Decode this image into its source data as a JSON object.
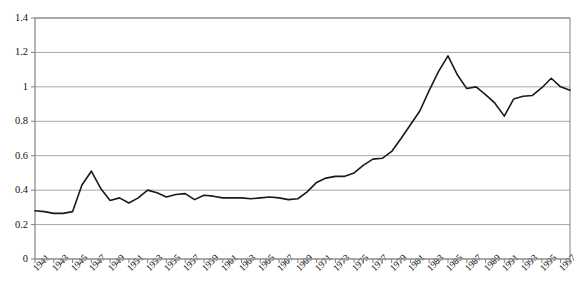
{
  "chart_data": {
    "type": "line",
    "title": "",
    "xlabel": "",
    "ylabel": "",
    "ylim": [
      0,
      1.4
    ],
    "xlim": [
      1941,
      1998
    ],
    "grid": true,
    "grid_axis": "y",
    "legend": false,
    "line_color": "#1a1a1a",
    "gridline_color": "#a6a6a6",
    "axis_color": "#808080",
    "ytick_values": [
      0,
      0.2,
      0.4,
      0.6,
      0.8,
      1,
      1.2,
      1.4
    ],
    "ytick_labels": [
      "0",
      "0.2",
      "0.4",
      "0.6",
      "0.8",
      "1",
      "1.2",
      "1.4"
    ],
    "xtick_labels": [
      "1941",
      "1943",
      "1945",
      "1947",
      "1949",
      "1951",
      "1953",
      "1955",
      "1957",
      "1959",
      "1961",
      "1963",
      "1965",
      "1967",
      "1969",
      "1971",
      "1973",
      "1975",
      "1977",
      "1979",
      "1981",
      "1983",
      "1985",
      "1987",
      "1989",
      "1991",
      "1993",
      "1995",
      "1997"
    ],
    "xtick_label_interval_years": 2,
    "minor_tick_interval_years": 1,
    "x": [
      1941,
      1942,
      1943,
      1944,
      1945,
      1946,
      1947,
      1948,
      1949,
      1950,
      1951,
      1952,
      1953,
      1954,
      1955,
      1956,
      1957,
      1958,
      1959,
      1960,
      1961,
      1962,
      1963,
      1964,
      1965,
      1966,
      1967,
      1968,
      1969,
      1970,
      1971,
      1972,
      1973,
      1974,
      1975,
      1976,
      1977,
      1978,
      1979,
      1980,
      1981,
      1982,
      1983,
      1984,
      1985,
      1986,
      1987,
      1988,
      1989,
      1990,
      1991,
      1992,
      1993,
      1994,
      1995,
      1996,
      1997,
      1998
    ],
    "series": [
      {
        "name": "value",
        "values": [
          0.28,
          0.275,
          0.265,
          0.265,
          0.275,
          0.43,
          0.51,
          0.41,
          0.34,
          0.355,
          0.325,
          0.355,
          0.4,
          0.385,
          0.36,
          0.375,
          0.38,
          0.345,
          0.37,
          0.365,
          0.355,
          0.355,
          0.355,
          0.35,
          0.355,
          0.36,
          0.355,
          0.345,
          0.35,
          0.39,
          0.445,
          0.47,
          0.48,
          0.48,
          0.5,
          0.545,
          0.58,
          0.585,
          0.625,
          0.7,
          0.78,
          0.86,
          0.98,
          1.09,
          1.18,
          1.07,
          0.99,
          1.0,
          0.955,
          0.905,
          0.83,
          0.93,
          0.945,
          0.95,
          0.995,
          1.05,
          1.0,
          0.98
        ]
      }
    ]
  },
  "axes": {
    "y_axis_name": "value-axis",
    "x_axis_name": "year-axis"
  }
}
